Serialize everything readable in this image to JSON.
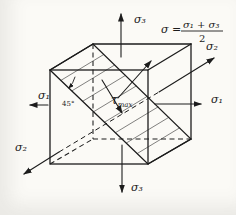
{
  "labels": {
    "sigma3_top": "σ₃",
    "sigma3_bottom": "σ₃",
    "sigma1_left": "σ₁",
    "sigma1_right": "σ₁",
    "sigma2_upper": "σ₂",
    "sigma2_lower": "σ₂",
    "angle": "45°",
    "tau": "τ",
    "tau_sub": "max"
  },
  "formula": {
    "lhs": "σ =",
    "numerator": "σ₁ + σ₃",
    "denominator": "2"
  },
  "colors": {
    "ink": "#1c1c1c",
    "paper": "#fbfaf6"
  }
}
